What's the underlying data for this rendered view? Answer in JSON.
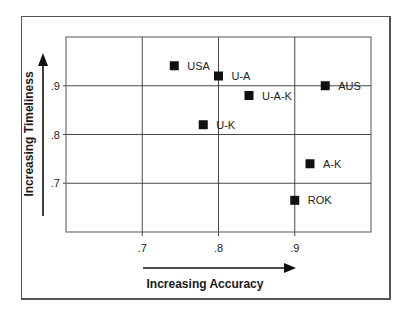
{
  "chart_data": {
    "type": "scatter",
    "title": "",
    "xlabel": "Increasing Accuracy",
    "ylabel": "Increasing Timeliness",
    "xlim": [
      0.6,
      1.0
    ],
    "ylim": [
      0.6,
      1.0
    ],
    "x_ticks": [
      ".7",
      ".8",
      ".9"
    ],
    "x_tick_values": [
      0.7,
      0.8,
      0.9
    ],
    "y_ticks": [
      ".7",
      ".8",
      ".9"
    ],
    "y_tick_values": [
      0.7,
      0.8,
      0.9
    ],
    "grid": true,
    "legend": null,
    "marker": "square",
    "points": [
      {
        "label": "USA",
        "x": 0.742,
        "y": 0.941
      },
      {
        "label": "U-A",
        "x": 0.8,
        "y": 0.92
      },
      {
        "label": "U-A-K",
        "x": 0.84,
        "y": 0.88
      },
      {
        "label": "U-K",
        "x": 0.78,
        "y": 0.82
      },
      {
        "label": "AUS",
        "x": 0.94,
        "y": 0.9
      },
      {
        "label": "A-K",
        "x": 0.92,
        "y": 0.74
      },
      {
        "label": "ROK",
        "x": 0.9,
        "y": 0.665
      }
    ]
  },
  "colors": {
    "marker": "#111111",
    "grid": "#333333",
    "frame": "#555555"
  }
}
